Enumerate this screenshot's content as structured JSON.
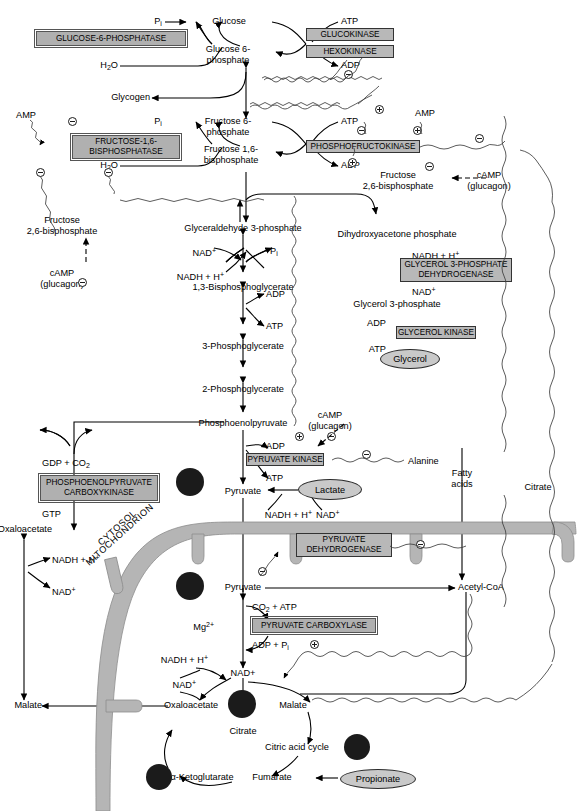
{
  "figure": {
    "compartments": [
      "CYTOSOL",
      "MITOCHONDRION"
    ]
  },
  "colors": {
    "enzyme_fill": "#b8b8b8",
    "enzyme_border": "#333333",
    "oval_fill": "#c9c9c9",
    "membrane": "#b5b5b5",
    "dot": "#1b1b1b",
    "line": "#000000"
  },
  "compartment_labels": [
    {
      "name": "cytosol",
      "text": "CYTOSOL"
    },
    {
      "name": "mitochondrion",
      "text": "MITOCHONDRION"
    }
  ],
  "enzymes": [
    {
      "name": "glucose-6-phosphatase",
      "label": "GLUCOSE-6-PHOSPHATASE",
      "style": "double"
    },
    {
      "name": "glucokinase",
      "label": "GLUCOKINASE",
      "style": "single"
    },
    {
      "name": "hexokinase",
      "label": "HEXOKINASE",
      "style": "single"
    },
    {
      "name": "fructose-1-6-bisphosphatase",
      "label": "FRUCTOSE-1,6-\nBISPHOSPHATASE",
      "line1": "FRUCTOSE-1,6-",
      "line2": "BISPHOSPHATASE",
      "style": "double"
    },
    {
      "name": "phosphofructokinase",
      "label": "PHOSPHOFRUCTOKINASE",
      "style": "single"
    },
    {
      "name": "glycerol-3-phosphate-dehydrogenase",
      "line1": "GLYCEROL 3-PHOSPHATE",
      "line2": "DEHYDROGENASE",
      "style": "single"
    },
    {
      "name": "glycerol-kinase",
      "label": "GLYCEROL KINASE",
      "style": "single"
    },
    {
      "name": "pyruvate-kinase",
      "label": "PYRUVATE KINASE",
      "style": "single"
    },
    {
      "name": "phosphoenolpyruvate-carboxykinase",
      "line1": "PHOSPHOENOLPYRUVATE",
      "line2": "CARBOXYKINASE",
      "style": "double"
    },
    {
      "name": "pyruvate-dehydrogenase",
      "line1": "PYRUVATE",
      "line2": "DEHYDROGENASE",
      "style": "single"
    },
    {
      "name": "pyruvate-carboxylase",
      "label": "PYRUVATE CARBOXYLASE",
      "style": "double"
    }
  ],
  "metabolite_ovals": [
    {
      "name": "glycerol-oval",
      "label": "Glycerol"
    },
    {
      "name": "lactate-oval",
      "label": "Lactate"
    },
    {
      "name": "propionate-oval",
      "label": "Propionate"
    }
  ],
  "metabolites": [
    {
      "name": "pi-top",
      "label": "Pi"
    },
    {
      "name": "glucose",
      "label": "Glucose"
    },
    {
      "name": "atp-glucokinase",
      "label": "ATP"
    },
    {
      "name": "h2o-g6pase",
      "label": "H2O"
    },
    {
      "name": "glucose-6-phosphate",
      "line1": "Glucose 6-",
      "line2": "phosphate"
    },
    {
      "name": "adp-glucokinase",
      "label": "ADP"
    },
    {
      "name": "glycogen",
      "label": "Glycogen"
    },
    {
      "name": "amp-fbpase",
      "label": "AMP"
    },
    {
      "name": "pi-fbpase",
      "label": "Pi"
    },
    {
      "name": "fructose-6-phosphate",
      "line1": "Fructose 6-",
      "line2": "phosphate"
    },
    {
      "name": "atp-pfk",
      "label": "ATP"
    },
    {
      "name": "amp-pfk",
      "label": "AMP"
    },
    {
      "name": "h2o-fbpase",
      "label": "H2O"
    },
    {
      "name": "fructose-1-6-bisphosphate",
      "line1": "Fructose 1,6-",
      "line2": "bisphosphate"
    },
    {
      "name": "adp-pfk",
      "label": "ADP"
    },
    {
      "name": "fructose-2-6-bisphosphate-right",
      "line1": "Fructose",
      "line2": "2,6-bisphosphate"
    },
    {
      "name": "camp-glucagon-right",
      "line1": "cAMP",
      "line2": "(glucagon)"
    },
    {
      "name": "fructose-2-6-bisphosphate-left",
      "line1": "Fructose",
      "line2": "2,6-bisphosphate"
    },
    {
      "name": "camp-glucagon-left",
      "line1": "cAMP",
      "line2": "(glucagon)"
    },
    {
      "name": "glyceraldehyde-3-phosphate",
      "label": "Glyceraldehyde 3-phosphate"
    },
    {
      "name": "nad-plus-gapdh",
      "label": "NAD+"
    },
    {
      "name": "pi-gapdh",
      "label": "Pi"
    },
    {
      "name": "nadh-h-gapdh",
      "label": "NADH + H+"
    },
    {
      "name": "1-3-bisphosphoglycerate",
      "label": "1,3-Bisphosphoglycerate"
    },
    {
      "name": "adp-pgk",
      "label": "ADP"
    },
    {
      "name": "atp-pgk",
      "label": "ATP"
    },
    {
      "name": "3-phosphoglycerate",
      "label": "3-Phosphoglycerate"
    },
    {
      "name": "2-phosphoglycerate",
      "label": "2-Phosphoglycerate"
    },
    {
      "name": "dihydroxyacetone-phosphate",
      "label": "Dihydroxyacetone phosphate"
    },
    {
      "name": "nadh-h-g3pdh",
      "label": "NADH + H+"
    },
    {
      "name": "nad-plus-g3pdh",
      "label": "NAD+"
    },
    {
      "name": "glycerol-3-phosphate",
      "label": "Glycerol 3-phosphate"
    },
    {
      "name": "adp-glycerolkinase",
      "label": "ADP"
    },
    {
      "name": "atp-glycerolkinase",
      "label": "ATP"
    },
    {
      "name": "phosphoenolpyruvate",
      "label": "Phosphoenolpyruvate"
    },
    {
      "name": "camp-glucagon-pk",
      "line1": "cAMP",
      "line2": "(glucagon)"
    },
    {
      "name": "adp-pk",
      "label": "ADP"
    },
    {
      "name": "atp-pk",
      "label": "ATP"
    },
    {
      "name": "alanine",
      "label": "Alanine"
    },
    {
      "name": "gdp-co2",
      "label": "GDP + CO2"
    },
    {
      "name": "gtp",
      "label": "GTP"
    },
    {
      "name": "pyruvate-cytosol",
      "label": "Pyruvate"
    },
    {
      "name": "nadh-h-ldh",
      "label": "NADH + H+"
    },
    {
      "name": "nad-plus-ldh",
      "label": "NAD+"
    },
    {
      "name": "fatty-acids",
      "line1": "Fatty",
      "line2": "acids"
    },
    {
      "name": "citrate-right",
      "label": "Citrate"
    },
    {
      "name": "oxaloacetate-cytosol",
      "label": "Oxaloacetate"
    },
    {
      "name": "nadh-h-mdh-cytosol",
      "label": "NADH + H+"
    },
    {
      "name": "nad-plus-mdh-cytosol",
      "label": "NAD+"
    },
    {
      "name": "malate-cytosol",
      "label": "Malate"
    },
    {
      "name": "pyruvate-mito",
      "label": "Pyruvate"
    },
    {
      "name": "acetyl-coa",
      "label": "Acetyl-CoA"
    },
    {
      "name": "co2-atp",
      "label": "CO2 + ATP"
    },
    {
      "name": "mg2plus",
      "label": "Mg2+"
    },
    {
      "name": "adp-pi",
      "label": "ADP + Pi"
    },
    {
      "name": "nadh-h-mdh-mito",
      "label": "NADH + H+"
    },
    {
      "name": "nad-plus-mdh-mito",
      "label": "NAD+"
    },
    {
      "name": "oxaloacetate-mito",
      "label": "Oxaloacetate"
    },
    {
      "name": "malate-mito",
      "label": "Malate"
    },
    {
      "name": "citrate-cycle",
      "label": "Citrate"
    },
    {
      "name": "citric-acid-cycle",
      "label": "Citric acid cycle"
    },
    {
      "name": "alpha-ketoglutarate",
      "label": "α-Ketoglutarate"
    },
    {
      "name": "fumarate",
      "label": "Fumarate"
    },
    {
      "name": "succinyl-coa",
      "label": "Succinyl-CoA"
    }
  ],
  "regulation_signs": [
    {
      "name": "minus-amp-fbpase",
      "sign": "minus"
    },
    {
      "name": "minus-glucokinase",
      "sign": "minus"
    },
    {
      "name": "plus-pfk-f6p",
      "sign": "plus"
    },
    {
      "name": "minus-atp-pfk",
      "sign": "minus"
    },
    {
      "name": "plus-amp-pfk",
      "sign": "plus"
    },
    {
      "name": "minus-citrate-pfk",
      "sign": "minus"
    },
    {
      "name": "plus-f26bp-pfk",
      "sign": "plus"
    },
    {
      "name": "minus-camp-f26bp-right",
      "sign": "minus"
    },
    {
      "name": "minus-f26bp-fbpase",
      "sign": "minus"
    },
    {
      "name": "minus-amp2-fbpase",
      "sign": "minus"
    },
    {
      "name": "minus-camp-f26bp-left",
      "sign": "minus"
    },
    {
      "name": "plus-fbp-pk",
      "sign": "plus"
    },
    {
      "name": "minus-camp-pk",
      "sign": "minus"
    },
    {
      "name": "minus-alanine-pk",
      "sign": "minus"
    },
    {
      "name": "minus-acetylcoa-pdh",
      "sign": "minus"
    },
    {
      "name": "minus-atp-pdh",
      "sign": "minus"
    },
    {
      "name": "plus-acetylcoa-pc",
      "sign": "plus"
    }
  ]
}
